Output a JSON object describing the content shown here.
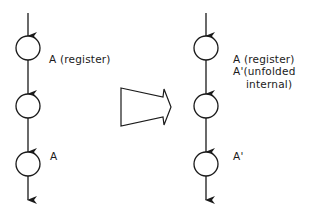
{
  "diagram": {
    "type": "retiming-unfolding-transformation",
    "colors": {
      "stroke": "#1a1a1a",
      "background": "#ffffff"
    },
    "left_chain": {
      "nodes": [
        {
          "id": "L1",
          "cx": 28,
          "cy": 48,
          "r": 12
        },
        {
          "id": "L2",
          "cx": 28,
          "cy": 106,
          "r": 12
        },
        {
          "id": "L3",
          "cx": 28,
          "cy": 164,
          "r": 12
        }
      ],
      "labels": {
        "first": "A (register)",
        "third": "A"
      }
    },
    "transform_arrow": {
      "direction": "right",
      "style": "outlined-block-arrow"
    },
    "right_chain": {
      "nodes": [
        {
          "id": "R1",
          "cx": 206,
          "cy": 48,
          "r": 12
        },
        {
          "id": "R2",
          "cx": 206,
          "cy": 106,
          "r": 12
        },
        {
          "id": "R3",
          "cx": 206,
          "cy": 164,
          "r": 12
        }
      ],
      "labels": {
        "first_line1": "A (register)",
        "first_line2": "A'(unfolded",
        "first_line3": "internal)",
        "third": "A'"
      }
    }
  }
}
